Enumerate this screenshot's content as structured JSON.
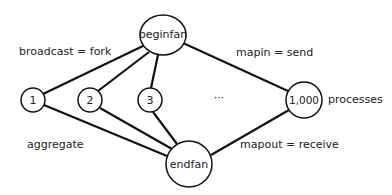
{
  "diagram": {
    "nodes": {
      "beginfan": {
        "label": "beginfan"
      },
      "endfan": {
        "label": "endfan"
      },
      "p1": {
        "label": "1"
      },
      "p2": {
        "label": "2"
      },
      "p3": {
        "label": "3"
      },
      "pN": {
        "label": "1,000"
      }
    },
    "ellipsis": "···",
    "annotations": {
      "broadcast": "broadcast = fork",
      "mapin": "mapin = send",
      "processes": "processes",
      "aggregate": "aggregate",
      "mapout": "mapout = receive"
    },
    "edges": [
      [
        "beginfan",
        "1"
      ],
      [
        "beginfan",
        "2"
      ],
      [
        "beginfan",
        "3"
      ],
      [
        "beginfan",
        "1,000"
      ],
      [
        "1",
        "endfan"
      ],
      [
        "2",
        "endfan"
      ],
      [
        "3",
        "endfan"
      ],
      [
        "1,000",
        "endfan"
      ]
    ],
    "colors": {
      "stroke": "#111111",
      "text": "#222222",
      "background": "#ffffff"
    }
  }
}
